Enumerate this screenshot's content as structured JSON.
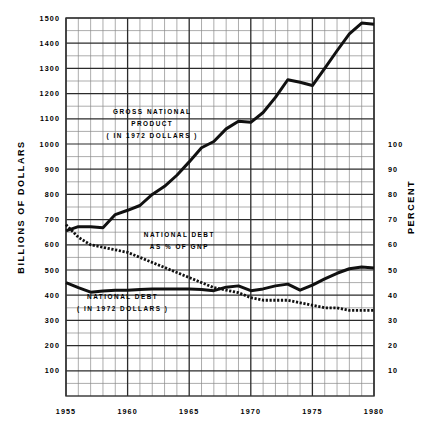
{
  "chart_data": {
    "type": "line",
    "title": "",
    "xlabel": "",
    "ylabel": "BILLIONS OF DOLLARS",
    "y2label": "PERCENT",
    "xlim": [
      1955,
      1980
    ],
    "ylim": [
      0,
      1500
    ],
    "y2lim": [
      0,
      150
    ],
    "grid": true,
    "legend": "inline-annotations",
    "x_ticks": [
      "1955",
      "1960",
      "1965",
      "1970",
      "1975",
      "1980"
    ],
    "x_tick_values": [
      1955,
      1960,
      1965,
      1970,
      1975,
      1980
    ],
    "y_ticks": [
      "100",
      "200",
      "300",
      "400",
      "500",
      "600",
      "700",
      "800",
      "900",
      "1000",
      "1100",
      "1200",
      "1300",
      "1400",
      "1500"
    ],
    "y_tick_values": [
      100,
      200,
      300,
      400,
      500,
      600,
      700,
      800,
      900,
      1000,
      1100,
      1200,
      1300,
      1400,
      1500
    ],
    "y2_ticks": [
      "10",
      "20",
      "30",
      "40",
      "50",
      "60",
      "70",
      "80",
      "90",
      "100"
    ],
    "y2_tick_values": [
      10,
      20,
      30,
      40,
      50,
      60,
      70,
      80,
      90,
      100
    ],
    "y_minor_step": 50,
    "x_minor_step": 1,
    "annotations": [
      {
        "id": "gnp",
        "lines": [
          "GROSS NATIONAL",
          "PRODUCT",
          "( IN 1972 DOLLARS )"
        ],
        "x": 1962,
        "y": 1120
      },
      {
        "id": "debt-pct",
        "lines": [
          "NATIONAL DEBT",
          "AS   %  OF GNP"
        ],
        "x": 1964.2,
        "y": 630
      },
      {
        "id": "debt-dollars",
        "lines": [
          "NATIONAL DEBT",
          "( IN 1972 DOLLARS )"
        ],
        "x": 1959.6,
        "y": 385
      }
    ],
    "series": [
      {
        "name": "GROSS NATIONAL PRODUCT ( IN 1972 DOLLARS )",
        "units": "billions of 1972 dollars",
        "style": "solid",
        "color": "#111111",
        "x": [
          1955,
          1956,
          1957,
          1958,
          1959,
          1960,
          1961,
          1962,
          1963,
          1964,
          1965,
          1966,
          1967,
          1968,
          1969,
          1970,
          1971,
          1972,
          1973,
          1974,
          1975,
          1976,
          1977,
          1978,
          1979,
          1980
        ],
        "values": [
          655,
          672,
          672,
          668,
          720,
          737,
          756,
          800,
          832,
          876,
          929,
          985,
          1010,
          1060,
          1090,
          1086,
          1125,
          1185,
          1255,
          1245,
          1232,
          1300,
          1370,
          1437,
          1480,
          1475
        ]
      },
      {
        "name": "NATIONAL DEBT AS % OF GNP",
        "units": "percent",
        "style": "dotted",
        "color": "#111111",
        "x": [
          1955,
          1956,
          1957,
          1958,
          1959,
          1960,
          1961,
          1962,
          1963,
          1964,
          1965,
          1966,
          1967,
          1968,
          1969,
          1970,
          1971,
          1972,
          1973,
          1974,
          1975,
          1976,
          1977,
          1978,
          1979,
          1980
        ],
        "values": [
          68,
          63,
          60,
          59,
          58,
          57,
          55,
          53,
          51,
          49,
          47,
          45,
          43,
          42,
          41,
          39,
          38,
          38,
          38,
          37,
          36,
          35,
          35,
          34,
          34,
          34
        ],
        "values_in_billions_scale": [
          680,
          630,
          600,
          590,
          580,
          570,
          550,
          530,
          510,
          490,
          470,
          450,
          430,
          420,
          410,
          390,
          380,
          380,
          380,
          370,
          360,
          350,
          350,
          340,
          340,
          340
        ]
      },
      {
        "name": "NATIONAL DEBT ( IN 1972 DOLLARS )",
        "units": "billions of 1972 dollars",
        "style": "solid",
        "color": "#111111",
        "x": [
          1955,
          1956,
          1957,
          1958,
          1959,
          1960,
          1961,
          1962,
          1963,
          1964,
          1965,
          1966,
          1967,
          1968,
          1969,
          1970,
          1971,
          1972,
          1973,
          1974,
          1975,
          1976,
          1977,
          1978,
          1979,
          1980
        ],
        "values": [
          450,
          430,
          412,
          417,
          420,
          420,
          423,
          425,
          425,
          425,
          425,
          423,
          418,
          432,
          437,
          418,
          425,
          437,
          444,
          420,
          440,
          465,
          487,
          505,
          512,
          508
        ]
      }
    ]
  },
  "axes": {
    "left_title": "BILLIONS OF DOLLARS",
    "right_title": "PERCENT"
  }
}
